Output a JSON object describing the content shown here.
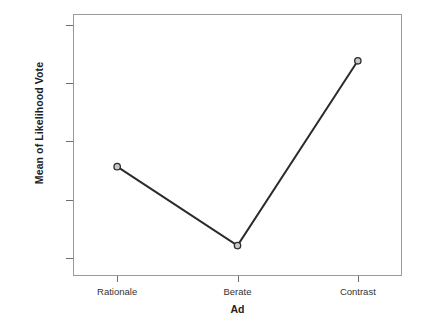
{
  "chart_data": {
    "type": "line",
    "title": "",
    "subtitle": "",
    "xlabel": "Ad",
    "ylabel": "Mean of Likelihood Vote",
    "categories": [
      "Rationale",
      "Berate",
      "Contrast"
    ],
    "values": [
      55.7,
      42.2,
      73.8
    ],
    "series": [
      {
        "name": "Mean of Likelihood Vote",
        "values": [
          55.7,
          42.2,
          73.8
        ]
      }
    ],
    "ylim": [
      37.0,
      81.8
    ],
    "yticks": [
      40,
      50,
      60,
      70,
      80
    ],
    "ytick_labels": [
      "40.00",
      "50.00",
      "60.00",
      "70.00",
      "80.00"
    ],
    "xtick_labels": [
      "Rationale",
      "Berate",
      "Contrast"
    ],
    "grid": false,
    "legend": false,
    "legend_position": "none",
    "marker": "open-circle",
    "line_color": "#2b2b2b",
    "marker_fill": "#c8c8c8",
    "marker_stroke": "#2b2b2b",
    "frame_color": "#9a9a9a",
    "background_color": "#ffffff",
    "text_color": "#333333"
  }
}
